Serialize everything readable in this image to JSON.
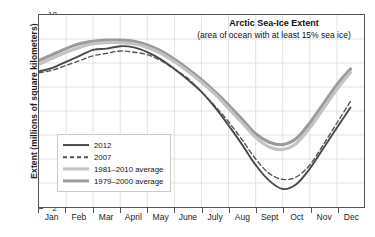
{
  "chart_data": {
    "type": "line",
    "title": "Arctic Sea-Ice Extent",
    "subtitle": "(area of ocean with at least 15% sea ice)",
    "xlabel": "",
    "ylabel": "Extent (millions of square kilometers)",
    "ylim": [
      2,
      18
    ],
    "yticks": [
      2,
      4,
      6,
      8,
      10,
      12,
      14,
      16,
      18
    ],
    "xticks": [
      "Jan",
      "Feb",
      "Mar",
      "April",
      "May",
      "June",
      "July",
      "Aug",
      "Sept",
      "Oct",
      "Nov",
      "Dec"
    ],
    "grid": true,
    "legend_position": "lower-left",
    "x": [
      0,
      0.5,
      1,
      1.5,
      2,
      2.5,
      3,
      3.5,
      4,
      4.5,
      5,
      5.5,
      6,
      6.5,
      7,
      7.5,
      8,
      8.5,
      9,
      9.5,
      10,
      10.5,
      11,
      11.5
    ],
    "series": [
      {
        "name": "2012",
        "color": "#4a4a4a",
        "style": "solid",
        "width": 1.9,
        "values": [
          13.3,
          13.6,
          14.1,
          14.6,
          15.1,
          15.2,
          15.4,
          15.3,
          14.9,
          14.3,
          13.5,
          12.6,
          11.6,
          10.3,
          8.8,
          7.2,
          5.5,
          4.2,
          3.5,
          3.9,
          5.2,
          6.9,
          8.6,
          10.3
        ]
      },
      {
        "name": "2007",
        "color": "#555555",
        "style": "dashed",
        "width": 1.4,
        "values": [
          13.2,
          13.4,
          13.8,
          14.2,
          14.6,
          14.8,
          15.0,
          14.9,
          14.7,
          14.2,
          13.5,
          12.7,
          11.6,
          10.4,
          9.1,
          7.6,
          6.0,
          4.8,
          4.3,
          4.5,
          5.5,
          7.2,
          9.0,
          10.8
        ]
      },
      {
        "name": "1981–2010 average",
        "color": "#c3c3c3",
        "style": "solid",
        "width": 3.2,
        "values": [
          13.9,
          14.4,
          14.9,
          15.3,
          15.6,
          15.7,
          15.7,
          15.6,
          15.3,
          14.8,
          14.1,
          13.3,
          12.4,
          11.4,
          10.2,
          9.0,
          7.8,
          7.0,
          6.8,
          7.3,
          8.6,
          10.2,
          11.8,
          13.2
        ]
      },
      {
        "name": "1979–2000 average",
        "color": "#9b9b9b",
        "style": "solid",
        "width": 3.2,
        "values": [
          14.2,
          14.7,
          15.2,
          15.6,
          15.8,
          15.9,
          15.9,
          15.8,
          15.5,
          15.0,
          14.3,
          13.5,
          12.6,
          11.6,
          10.5,
          9.3,
          8.1,
          7.4,
          7.2,
          7.7,
          9.0,
          10.6,
          12.2,
          13.5
        ]
      }
    ]
  }
}
